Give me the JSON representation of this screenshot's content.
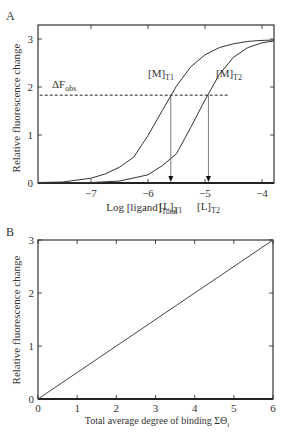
{
  "chart_data": [
    {
      "panel": "A",
      "type": "line",
      "xlabel_main": "Log [ligand]",
      "xlabel_sub": "Total",
      "ylabel": "Relative fluorescence change",
      "xlim": [
        -7.93,
        -3.79
      ],
      "ylim": [
        0,
        3.3
      ],
      "x_ticks": [
        -7,
        -6,
        -5,
        -4
      ],
      "x_tick_labels": [
        "−7",
        "−6",
        "−5",
        "−4"
      ],
      "y_ticks": [
        0,
        1,
        2,
        3
      ],
      "y_tick_labels": [
        "0",
        "1",
        "2",
        "3"
      ],
      "grid": false,
      "series": [
        {
          "name": "[M]T1",
          "label_main": "[M]",
          "label_sub": "T1",
          "model": "3/(1+10^(1.2*(-5.76-x)))",
          "x": [
            -7.93,
            -7.5,
            -7.0,
            -6.75,
            -6.5,
            -6.25,
            -6.0,
            -5.75,
            -5.5,
            -5.25,
            -5.0,
            -4.75,
            -4.5,
            -4.25,
            -4.0,
            -3.79
          ],
          "y": [
            0.01,
            0.02,
            0.1,
            0.19,
            0.33,
            0.54,
            0.99,
            1.51,
            2.02,
            2.42,
            2.67,
            2.82,
            2.9,
            2.95,
            2.97,
            2.98
          ]
        },
        {
          "name": "[M]T2",
          "label_main": "[M]",
          "label_sub": "T2",
          "model": "3/(1+10^(1.4*(-5.10-x)))",
          "x": [
            -7.93,
            -7.0,
            -6.5,
            -6.0,
            -5.75,
            -5.5,
            -5.25,
            -5.0,
            -4.75,
            -4.5,
            -4.25,
            -4.0,
            -3.79
          ],
          "y": [
            0.0,
            0.01,
            0.04,
            0.17,
            0.36,
            0.61,
            1.16,
            1.73,
            2.26,
            2.62,
            2.82,
            2.92,
            2.96
          ]
        }
      ],
      "annotations": {
        "delta_f_obs": {
          "label_main": "ΔF",
          "label_sub": "obs",
          "y": 1.83,
          "x_start": -7.9,
          "x_end": -4.6
        },
        "L_T1": {
          "label_main": "[L]",
          "label_sub": "T1",
          "x": -5.6
        },
        "L_T2": {
          "label_main": "[L]",
          "label_sub": "T2",
          "x": -4.94
        }
      }
    },
    {
      "panel": "B",
      "type": "line",
      "xlabel_main": "Total average degree of binding  ΣΘ",
      "xlabel_sub": "i",
      "ylabel": "Relative fluorescence change",
      "xlim": [
        0,
        6
      ],
      "ylim": [
        0,
        3
      ],
      "x_ticks": [
        0,
        1,
        2,
        3,
        4,
        5,
        6
      ],
      "x_tick_labels": [
        "0",
        "1",
        "2",
        "3",
        "4",
        "5",
        "6"
      ],
      "y_ticks": [
        0,
        1,
        2,
        3
      ],
      "y_tick_labels": [
        "0",
        "1",
        "2",
        "3"
      ],
      "grid": false,
      "series": [
        {
          "name": "linear",
          "x": [
            0,
            6
          ],
          "y": [
            0,
            3
          ]
        }
      ]
    }
  ],
  "panels": {
    "a_label": "A",
    "b_label": "B"
  }
}
